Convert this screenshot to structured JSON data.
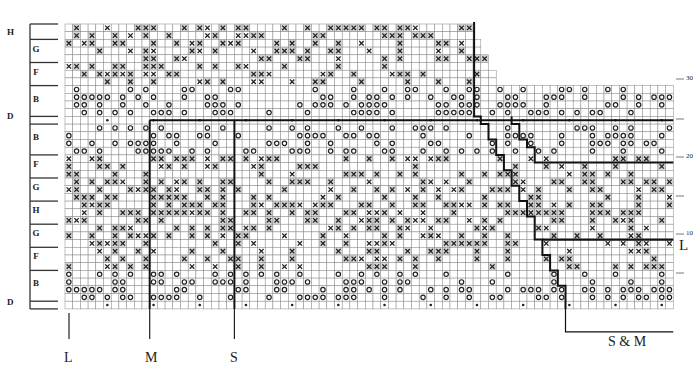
{
  "chart_title": "",
  "grid": {
    "cols": 79,
    "rows": 37,
    "origin_x": 65,
    "origin_y": 24,
    "cell": 7.7,
    "top_row_ends_by_row": {
      "0": 53,
      "1": 53,
      "2": 54,
      "3": 54,
      "4": 55,
      "5": 55,
      "6": 56,
      "7": 56
    }
  },
  "colors": {
    "grid_line": "#888888",
    "grid_shade": "#d6d6d6",
    "heavy_line": "#111111",
    "symbol": "#222222"
  },
  "legend_symbols": {
    "x": "cross-stitch",
    "o": "circle-stitch",
    "dot": "dot-stitch"
  },
  "left_bands": [
    {
      "label": "H",
      "rows": 2,
      "outside": true
    },
    {
      "label": "G",
      "rows": 3
    },
    {
      "label": "F",
      "rows": 3
    },
    {
      "label": "B",
      "rows": 4
    },
    {
      "label": "D",
      "rows": 1,
      "outside": true
    },
    {
      "label": "B",
      "rows": 4
    },
    {
      "label": "F",
      "rows": 3
    },
    {
      "label": "G",
      "rows": 3
    },
    {
      "label": "H",
      "rows": 3
    },
    {
      "label": "G",
      "rows": 3
    },
    {
      "label": "F",
      "rows": 3
    },
    {
      "label": "B",
      "rows": 4
    },
    {
      "label": "D",
      "rows": 1,
      "outside": true
    }
  ],
  "band_labels": {
    "h_top": "H",
    "g1": "G",
    "f1": "F",
    "b1": "B",
    "d_mid": "D",
    "b2": "B",
    "f2": "F",
    "g2": "G",
    "h2": "H",
    "g3": "G",
    "f3": "F",
    "b3": "B",
    "d_bot": "D"
  },
  "right_ticks": {
    "t30": "30",
    "t20": "20",
    "t10": "10",
    "dash": "—"
  },
  "size_labels": {
    "L": "L",
    "M": "M",
    "S": "S",
    "SM": "S & M",
    "L_right": "L"
  },
  "chart_data": {
    "type": "table",
    "row_numbers_shown": [
      10,
      20,
      30
    ],
    "size_markers_bottom": [
      "L",
      "M",
      "S",
      "S & M"
    ],
    "size_marker_right": "L",
    "band_sequence_bottom_to_top": [
      "D",
      "B",
      "F",
      "G",
      "H",
      "G",
      "F",
      "B",
      "D",
      "B",
      "F",
      "G",
      "H"
    ]
  }
}
